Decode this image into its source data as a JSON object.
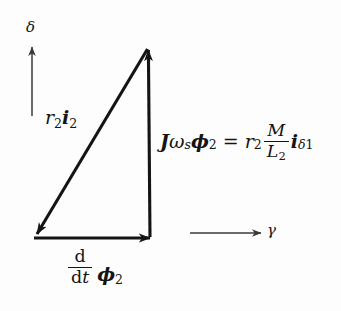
{
  "figure": {
    "kind": "phasor-vector-diagram",
    "background_color": "#fdfdfd",
    "stroke_color": "#141414",
    "width": 341,
    "height": 311
  },
  "axes": {
    "vertical": {
      "name": "delta-axis",
      "label": "δ",
      "direction": "up"
    },
    "horizontal": {
      "name": "gamma-axis",
      "label": "γ",
      "direction": "right"
    }
  },
  "vectors": {
    "hypotenuse": {
      "name": "r2-i2-vector",
      "label_parts": {
        "r": "r",
        "r_sub": "2",
        "i": "i",
        "i_sub": "2"
      },
      "label_plain": "r₂i₂",
      "direction": "down-left"
    },
    "vertical": {
      "name": "J-omega-s-phi2-vector",
      "label_plain": "Jωₛϕ₂ = r₂ M/L₂ i_δ1",
      "direction": "up",
      "equation": {
        "lhs": {
          "J": "J",
          "omega": "ω",
          "omega_sub": "s",
          "phi": "ϕ",
          "phi_sub": "2"
        },
        "equals": "=",
        "rhs": {
          "r": "r",
          "r_sub": "2",
          "frac_num": "M",
          "frac_den": "L",
          "frac_den_sub": "2",
          "i": "i",
          "i_sub_delta": "δ",
          "i_sub_one": "1"
        }
      }
    },
    "base": {
      "name": "ddt-phi2-vector",
      "label_plain": "(d/dt)ϕ₂",
      "direction": "right",
      "equation": {
        "frac_num": "d",
        "frac_den_d": "d",
        "frac_den_t": "t",
        "phi": "ϕ",
        "phi_sub": "2"
      }
    }
  }
}
